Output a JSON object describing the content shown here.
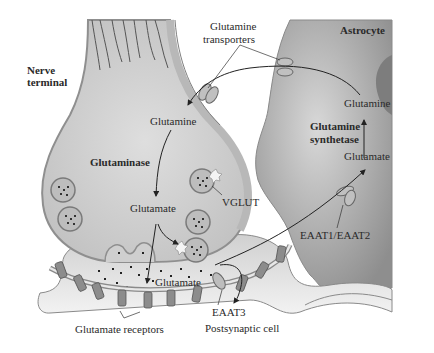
{
  "diagram": {
    "colors": {
      "neuron_fill": "#c9c9c9",
      "neuron_membrane": "#9a9a9a",
      "astrocyte_fill": "#a8a8a8",
      "astrocyte_nucleus": "#7d7d7d",
      "postsynaptic_fill": "#dcdcdc",
      "receptor_fill": "#8c8c8c",
      "text": "#2a2a2a",
      "background": "#ffffff"
    },
    "labels": {
      "nerve_terminal": "Nerve\nterminal",
      "nerve_terminal_line1": "Nerve",
      "nerve_terminal_line2": "terminal",
      "glutamine_transporters_line1": "Glutamine",
      "glutamine_transporters_line2": "transporters",
      "astrocyte": "Astrocyte",
      "astro_glutamine": "Glutamine",
      "glutamine_synthetase_line1": "Glutamine",
      "glutamine_synthetase_line2": "synthetase",
      "astro_glutamate": "Glutamate",
      "neuron_glutamine": "Glutamine",
      "glutaminase": "Glutaminase",
      "neuron_glutamate": "Glutamate",
      "vglut": "VGLUT",
      "eaat1_eaat2": "EAAT1/EAAT2",
      "cleft_glutamate": "Glutamate",
      "eaat3": "EAAT3",
      "postsynaptic_cell": "Postsynaptic cell",
      "glutamate_receptors": "Glutamate receptors"
    },
    "nodes": [
      {
        "id": "nerve-terminal",
        "label": "Nerve terminal"
      },
      {
        "id": "astrocyte",
        "label": "Astrocyte"
      },
      {
        "id": "postsynaptic-cell",
        "label": "Postsynaptic cell"
      },
      {
        "id": "glutamine-transporters",
        "label": "Glutamine transporters"
      },
      {
        "id": "vglut",
        "label": "VGLUT"
      },
      {
        "id": "eaat1-eaat2",
        "label": "EAAT1/EAAT2"
      },
      {
        "id": "eaat3",
        "label": "EAAT3"
      },
      {
        "id": "glutamate-receptors",
        "label": "Glutamate receptors"
      }
    ],
    "edges": [
      {
        "from": "Glutamine (astrocyte)",
        "to": "Glutamine (nerve terminal)",
        "via": "Glutamine transporters"
      },
      {
        "from": "Glutamine (nerve terminal)",
        "to": "Glutamate (nerve terminal)",
        "via": "Glutaminase"
      },
      {
        "from": "Glutamate (nerve terminal)",
        "to": "Synaptic vesicle",
        "via": "VGLUT"
      },
      {
        "from": "Synaptic vesicle",
        "to": "Glutamate (cleft)",
        "via": "exocytosis"
      },
      {
        "from": "Glutamate (cleft)",
        "to": "Glutamate (astrocyte)",
        "via": "EAAT1/EAAT2"
      },
      {
        "from": "Glutamate (cleft)",
        "to": "Postsynaptic cell",
        "via": "EAAT3"
      },
      {
        "from": "Glutamate (astrocyte)",
        "to": "Glutamine (astrocyte)",
        "via": "Glutamine synthetase"
      }
    ]
  }
}
